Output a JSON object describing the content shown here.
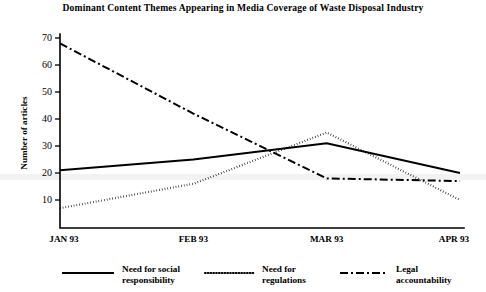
{
  "chart_data": {
    "type": "line",
    "title": "Dominant Content Themes Appearing in Media Coverage of Waste Disposal Industry",
    "xlabel": "",
    "ylabel": "Number of articles",
    "categories": [
      "JAN 93",
      "FEB 93",
      "MAR 93",
      "APR 93"
    ],
    "x_tick_labels": [
      "JAN 93",
      "FEB 93",
      "MAR 93",
      "APR 93"
    ],
    "y_tick_labels": [
      "10",
      "20",
      "30",
      "40",
      "50",
      "60",
      "70"
    ],
    "y_ticks": [
      10,
      20,
      30,
      40,
      50,
      60,
      70
    ],
    "ylim": [
      3,
      70
    ],
    "xlim": [
      0,
      3
    ],
    "grid": false,
    "legend_position": "bottom",
    "series": [
      {
        "name": "Need for social responsibility",
        "legend_label_line1": "Need for social",
        "legend_label_line2": "responsibility",
        "style": "solid",
        "color": "#000000",
        "values": [
          21,
          25,
          31,
          20
        ]
      },
      {
        "name": "Need for regulations",
        "legend_label_line1": "Need for",
        "legend_label_line2": "regulations",
        "style": "dotted",
        "color": "#000000",
        "values": [
          7,
          16,
          35,
          10
        ]
      },
      {
        "name": "Legal accountability",
        "legend_label_line1": "Legal",
        "legend_label_line2": "accountability",
        "style": "dashdot",
        "color": "#000000",
        "values": [
          68,
          42,
          18,
          17
        ]
      }
    ]
  }
}
